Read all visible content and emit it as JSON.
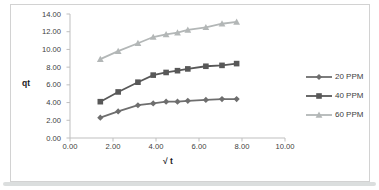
{
  "chart_data": {
    "type": "line",
    "title": "",
    "xlabel": "√ t",
    "ylabel": "qt",
    "xlim": [
      0,
      10
    ],
    "ylim": [
      0,
      14
    ],
    "x_ticks": [
      "0.00",
      "2.00",
      "4.00",
      "6.00",
      "8.00",
      "10.00"
    ],
    "y_ticks": [
      "0.00",
      "2.00",
      "4.00",
      "6.00",
      "8.00",
      "10.00",
      "12.00",
      "14.00"
    ],
    "grid": false,
    "legend_position": "right",
    "x": [
      1.41,
      2.24,
      3.16,
      3.87,
      4.47,
      5.0,
      5.48,
      6.32,
      7.07,
      7.75
    ],
    "series": [
      {
        "name": "20 PPM",
        "marker": "diamond",
        "color": "#6e6e6e",
        "values": [
          2.3,
          3.0,
          3.7,
          3.9,
          4.1,
          4.1,
          4.2,
          4.3,
          4.4,
          4.4
        ]
      },
      {
        "name": "40 PPM",
        "marker": "square",
        "color": "#585858",
        "values": [
          4.1,
          5.2,
          6.3,
          7.1,
          7.4,
          7.6,
          7.8,
          8.1,
          8.2,
          8.4
        ]
      },
      {
        "name": "60 PPM",
        "marker": "triangle",
        "color": "#b3b7b7",
        "values": [
          8.9,
          9.8,
          10.7,
          11.4,
          11.7,
          11.9,
          12.2,
          12.5,
          12.9,
          13.1
        ]
      }
    ]
  },
  "style": {
    "axis_color": "#bfbfbf",
    "tick_text_color": "#404040",
    "border_color": "#d2d2d2"
  }
}
